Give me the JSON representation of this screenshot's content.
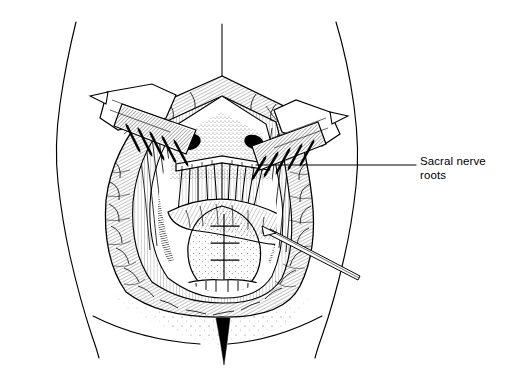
{
  "figure": {
    "kind": "medical-line-illustration",
    "technique": "pen-and-ink hatching and stippling",
    "view": "posterior (dorsal) view of lower back and buttocks",
    "width_px": 505,
    "height_px": 379,
    "background_color": "#ffffff",
    "ink_color": "#000000"
  },
  "callouts": [
    {
      "id": "sacral-nerve-roots",
      "line1": "Sacral nerve",
      "line2": "roots",
      "text": "Sacral nerve\nroots",
      "label_x": 420,
      "label_y": 155,
      "leader_from_x": 416,
      "leader_from_y": 165,
      "leader_to_x": 256,
      "leader_to_y": 165
    }
  ],
  "anatomy": {
    "body_outline": {
      "name": "torso-and-buttock-contour",
      "left_contour_label": "left flank and hip contour",
      "right_contour_label": "right flank and hip contour",
      "gluteal_fold_label": "gluteal folds",
      "natal_cleft_label": "natal cleft"
    },
    "midline_marker": {
      "name": "midline-reference-line",
      "x": 222,
      "y_top": 24,
      "y_bottom": 76
    },
    "wound": {
      "name": "sacral-surgical-wound",
      "shape": "vertical ovoid with pointed superior apex",
      "apex_x": 222,
      "apex_y": 76,
      "left_x": 104,
      "right_x": 302,
      "bottom_y": 316
    },
    "structures": [
      {
        "id": "skin-edge",
        "label": "retracted skin and subcutaneous fat edge"
      },
      {
        "id": "muscle-layer",
        "label": "paraspinal muscle layer"
      },
      {
        "id": "sacral-nerve-roots",
        "label": "sacral nerve roots"
      },
      {
        "id": "transverse-bar",
        "label": "transverse dural band"
      },
      {
        "id": "sutured-flap",
        "label": "sutured flap closure"
      },
      {
        "id": "sacral-bone",
        "label": "sacral bone surface"
      }
    ]
  },
  "instruments": [
    {
      "id": "left-rake-retractor",
      "label": "rake retractor (left)",
      "prong_count": 5,
      "handle_direction": "upper-left"
    },
    {
      "id": "right-rake-retractor",
      "label": "rake retractor (right)",
      "prong_count": 5,
      "handle_direction": "upper-right"
    },
    {
      "id": "probe-forceps",
      "label": "nerve probe / forceps",
      "tip_x": 272,
      "tip_y": 232,
      "end_x": 360,
      "end_y": 277
    }
  ]
}
